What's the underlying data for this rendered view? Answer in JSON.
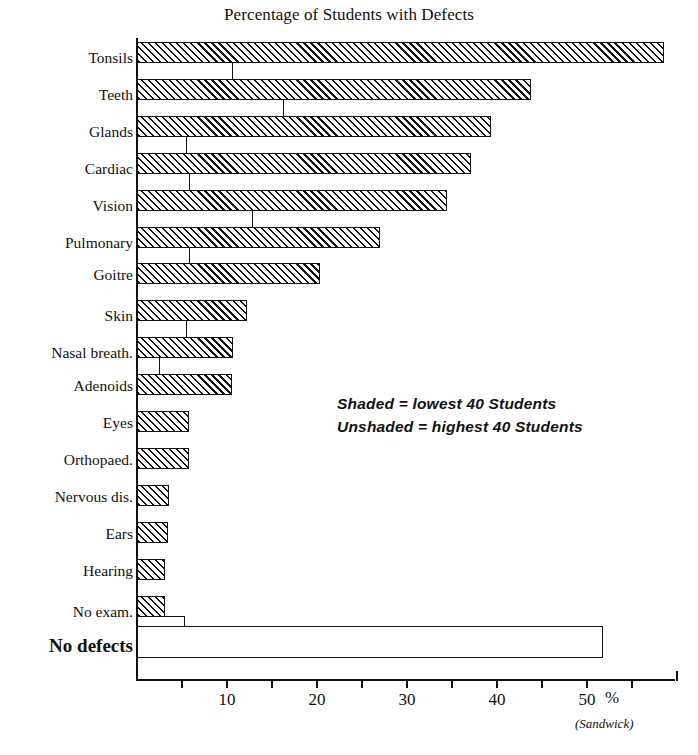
{
  "top_fragment": "",
  "title": "Percentage of Students with Defects",
  "source": "(Sandwick)",
  "percent_symbol": "%",
  "legend": {
    "line1": "Shaded = lowest 40 Students",
    "line2": "Unshaded = highest 40 Students"
  },
  "axis": {
    "tick_labels": [
      "10",
      "20",
      "30",
      "40",
      "50"
    ],
    "tick_values": [
      10,
      20,
      30,
      40,
      50
    ],
    "minor_tick_values": [
      5,
      15,
      25,
      35,
      45,
      55
    ],
    "min": 0,
    "max": 60
  },
  "chart_data": {
    "type": "bar",
    "orientation": "horizontal",
    "title": "Percentage of Students with Defects",
    "xlabel": "%",
    "ylabel": "",
    "xlim": [
      0,
      60
    ],
    "grid": false,
    "legend_position": "center-right",
    "annotations": [
      "Shaded = lowest 40 Students",
      "Unshaded = highest 40 Students",
      "(Sandwick)"
    ],
    "categories": [
      "Tonsils",
      "Teeth",
      "Glands",
      "Cardiac",
      "Vision",
      "Pulmonary",
      "Goitre",
      "Skin",
      "Nasal breath.",
      "Adenoids",
      "Eyes",
      "Orthopaed.",
      "Nervous dis.",
      "Ears",
      "Hearing",
      "No exam.",
      "No defects"
    ],
    "series": [
      {
        "name": "Shaded = lowest 40 Students",
        "pattern": "hatched",
        "values": [
          58.5,
          43.8,
          39.3,
          37.1,
          34.4,
          27.0,
          20.3,
          12.2,
          10.7,
          10.6,
          5.8,
          5.8,
          3.6,
          3.4,
          3.1,
          3.1,
          0
        ]
      },
      {
        "name": "Unshaded = highest 40 Students",
        "pattern": "open",
        "values": [
          10.7,
          16.3,
          5.6,
          5.9,
          12.9,
          5.9,
          0,
          5.6,
          2.6,
          0,
          0,
          0,
          0,
          0,
          0,
          5.3,
          51.8
        ]
      }
    ]
  },
  "rows": [
    {
      "label": "Tonsils",
      "shaded": 58.5,
      "unshaded": 10.7,
      "big": false
    },
    {
      "label": "Teeth",
      "shaded": 43.8,
      "unshaded": 16.3,
      "big": false
    },
    {
      "label": "Glands",
      "shaded": 39.3,
      "unshaded": 5.6,
      "big": false
    },
    {
      "label": "Cardiac",
      "shaded": 37.1,
      "unshaded": 5.9,
      "big": false
    },
    {
      "label": "Vision",
      "shaded": 34.4,
      "unshaded": 12.9,
      "big": false
    },
    {
      "label": "Pulmonary",
      "shaded": 27.0,
      "unshaded": 5.9,
      "big": false
    },
    {
      "label": "Goitre",
      "shaded": 20.3,
      "unshaded": 0,
      "big": false
    },
    {
      "label": "Skin",
      "shaded": 12.2,
      "unshaded": 5.6,
      "big": false
    },
    {
      "label": "Nasal breath.",
      "shaded": 10.7,
      "unshaded": 2.6,
      "big": false
    },
    {
      "label": "Adenoids",
      "shaded": 10.6,
      "unshaded": 0,
      "big": false
    },
    {
      "label": "Eyes",
      "shaded": 5.8,
      "unshaded": 0,
      "big": false
    },
    {
      "label": "Orthopaed.",
      "shaded": 5.8,
      "unshaded": 0,
      "big": false
    },
    {
      "label": "Nervous dis.",
      "shaded": 3.6,
      "unshaded": 0,
      "big": false
    },
    {
      "label": "Ears",
      "shaded": 3.4,
      "unshaded": 0,
      "big": false
    },
    {
      "label": "Hearing",
      "shaded": 3.1,
      "unshaded": 0,
      "big": false
    },
    {
      "label": "No exam.",
      "shaded": 3.1,
      "unshaded": 5.3,
      "big": false
    },
    {
      "label": "No defects",
      "shaded": 0,
      "unshaded": 51.8,
      "big": true
    }
  ]
}
